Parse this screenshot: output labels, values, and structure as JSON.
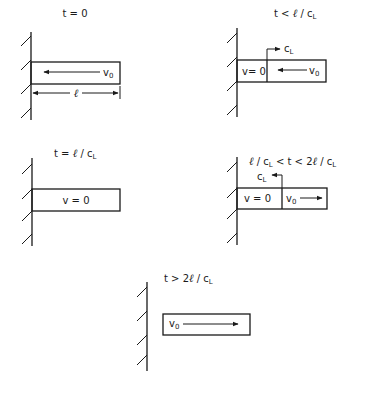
{
  "diagram": {
    "ink_color": "#1a1a1a",
    "background": "#ffffff",
    "panels": [
      {
        "id": "t0",
        "title": "t = 0",
        "bar_label": "v",
        "bar_label_sub": "0",
        "velocity_direction": "left",
        "dimension_label": "ℓ"
      },
      {
        "id": "t-lt-l-over-cl",
        "title_parts": [
          "t < ",
          "ℓ",
          " / c",
          "L"
        ],
        "left_zone_label": "v= 0",
        "right_zone_label": "v",
        "right_zone_sub": "0",
        "velocity_direction": "left",
        "wave_label": "c",
        "wave_label_sub": "L",
        "wave_direction": "right"
      },
      {
        "id": "t-eq-l-over-cl",
        "title_parts": [
          "t = ",
          "ℓ",
          " / c",
          "L"
        ],
        "bar_label": "v = 0"
      },
      {
        "id": "t-between",
        "title_parts": [
          "ℓ",
          " / c",
          "L",
          " < t < 2",
          "ℓ",
          " / c",
          "L"
        ],
        "left_zone_label": "v = 0",
        "right_zone_label": "v",
        "right_zone_sub": "0",
        "velocity_direction": "right",
        "wave_label": "c",
        "wave_label_sub": "L",
        "wave_direction": "left"
      },
      {
        "id": "t-gt-2l-over-cl",
        "title_parts": [
          "t > 2",
          "ℓ",
          " / c",
          "L"
        ],
        "bar_label": "v",
        "bar_label_sub": "0",
        "velocity_direction": "right"
      }
    ]
  }
}
